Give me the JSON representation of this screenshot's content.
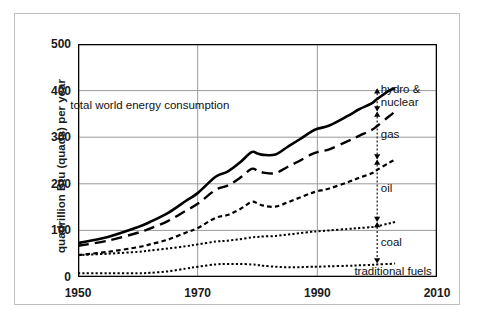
{
  "chart_data": {
    "type": "area",
    "title": "",
    "xlabel": "",
    "ylabel": "quadrillion Btu (quads) per year",
    "xlim": [
      1950,
      2010
    ],
    "ylim": [
      0,
      500
    ],
    "xticks": [
      1950,
      1970,
      1990,
      2010
    ],
    "yticks": [
      0,
      100,
      200,
      300,
      400,
      500
    ],
    "grid": true,
    "legend_position": "inline-annotations",
    "stacked_cumulative": true,
    "note": "Cumulative stacked curves: each curve is the running total of the bands below it. Top solid curve is total world energy consumption.",
    "x": [
      1950,
      1955,
      1960,
      1962,
      1965,
      1968,
      1970,
      1973,
      1975,
      1977,
      1979,
      1980,
      1981,
      1983,
      1985,
      1987,
      1989,
      1990,
      1992,
      1995,
      1997,
      1999,
      2000,
      2002,
      2003
    ],
    "series": [
      {
        "name": "total world energy consumption",
        "band_label": "hydro & nuclear",
        "style": "solid",
        "linewidth": 2.6,
        "values": [
          73,
          86,
          107,
          118,
          137,
          163,
          180,
          215,
          226,
          245,
          268,
          265,
          262,
          263,
          279,
          295,
          312,
          318,
          325,
          345,
          360,
          372,
          382,
          400,
          405
        ]
      },
      {
        "name": "cumulative through gas",
        "band_label": "gas",
        "style": "dashed",
        "linewidth": 2.4,
        "values": [
          67,
          78,
          95,
          104,
          120,
          142,
          157,
          187,
          196,
          212,
          232,
          228,
          224,
          223,
          236,
          249,
          263,
          268,
          274,
          291,
          303,
          315,
          324,
          345,
          355
        ]
      },
      {
        "name": "cumulative through oil",
        "band_label": "oil",
        "style": "dotted-coarse",
        "linewidth": 2.2,
        "values": [
          47,
          54,
          64,
          70,
          80,
          95,
          105,
          127,
          133,
          145,
          161,
          158,
          153,
          151,
          160,
          170,
          180,
          184,
          190,
          203,
          213,
          222,
          230,
          245,
          252
        ]
      },
      {
        "name": "cumulative through coal",
        "band_label": "coal",
        "style": "dotted-fine",
        "linewidth": 2.0,
        "values": [
          47,
          50,
          54,
          57,
          61,
          66,
          70,
          76,
          78,
          81,
          85,
          86,
          87,
          88,
          91,
          94,
          97,
          98,
          100,
          103,
          105,
          107,
          109,
          115,
          118
        ]
      },
      {
        "name": "traditional fuels",
        "band_label": "traditional fuels",
        "style": "dotted-fine",
        "linewidth": 2.0,
        "values": [
          8,
          8,
          8,
          9,
          12,
          18,
          22,
          27,
          28,
          28,
          27,
          26,
          24,
          22,
          21,
          21,
          22,
          22,
          23,
          24,
          25,
          26,
          27,
          28,
          29
        ]
      }
    ],
    "annotations": [
      {
        "name": "total-label",
        "text": "total world energy consumption",
        "x": 1962,
        "y": 370
      },
      {
        "name": "hydro-nuclear-label",
        "text": "hydro &\nnuclear",
        "x": 2001,
        "y": 395,
        "band_between": [
          355,
          405
        ]
      },
      {
        "name": "gas-label",
        "text": "gas",
        "x": 2001,
        "y": 305,
        "band_between": [
          252,
          355
        ]
      },
      {
        "name": "oil-label",
        "text": "oil",
        "x": 2001,
        "y": 190,
        "band_between": [
          118,
          252
        ]
      },
      {
        "name": "coal-label",
        "text": "coal",
        "x": 2001,
        "y": 75,
        "band_between": [
          29,
          118
        ]
      },
      {
        "name": "traditional-fuels-label",
        "text": "traditional fuels",
        "x": 2001,
        "y": 14,
        "band_between": [
          0,
          29
        ]
      }
    ],
    "arrows": [
      {
        "name": "hydro-nuclear-arrow",
        "x": 2000,
        "y0": 355,
        "y1": 405
      },
      {
        "name": "gas-arrow",
        "x": 2000,
        "y0": 252,
        "y1": 355
      },
      {
        "name": "oil-arrow",
        "x": 2000,
        "y0": 118,
        "y1": 252
      },
      {
        "name": "coal-arrow",
        "x": 2000,
        "y0": 29,
        "y1": 118
      }
    ]
  },
  "axis": {
    "y_title": "quadrillion Btu (quads) per year",
    "y_tick_labels": [
      "0",
      "100",
      "200",
      "300",
      "400",
      "500"
    ],
    "x_tick_labels": [
      "1950",
      "1970",
      "1990",
      "2010"
    ]
  },
  "labels": {
    "total": "total world energy consumption",
    "hydro_nuclear_line1": "hydro &",
    "hydro_nuclear_line2": "nuclear",
    "gas": "gas",
    "oil": "oil",
    "coal": "coal",
    "traditional_fuels": "traditional fuels"
  },
  "colors": {
    "line": "#000000",
    "grid": "#9a9a9a",
    "axis": "#000000",
    "outer_frame": "#bfbfbf",
    "background": "#ffffff",
    "text": "#1a1a1a"
  }
}
